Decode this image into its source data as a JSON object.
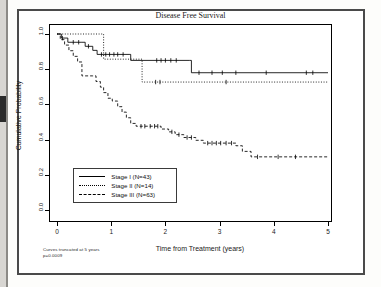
{
  "figure": {
    "title": "Disease Free Survival",
    "xlabel": "Time from Treatment (years)",
    "ylabel": "Cumulative Probability",
    "footnote_line1": "Curves truncated at 5 years",
    "footnote_line2": "p=0.0009"
  },
  "legend": {
    "items": [
      {
        "label": "Stage I (N=43)",
        "style": "solid"
      },
      {
        "label": "Stage II (N=14)",
        "style": "dotted"
      },
      {
        "label": "Stage III (N=63)",
        "style": "dashed"
      }
    ]
  },
  "axis": {
    "x_ticks": [
      "0",
      "1",
      "2",
      "3",
      "4",
      "5"
    ],
    "y_ticks": [
      "0.0",
      "0.2",
      "0.4",
      "0.6",
      "0.8",
      "1.0"
    ]
  },
  "chart_data": {
    "type": "line",
    "title": "Disease Free Survival",
    "xlabel": "Time from Treatment (years)",
    "ylabel": "Cumulative Probability",
    "xlim": [
      0,
      5
    ],
    "ylim": [
      0.0,
      1.0
    ],
    "grid": false,
    "legend_position": "lower-left",
    "annotations": [
      "Curves truncated at 5 years",
      "p=0.0009"
    ],
    "series": [
      {
        "name": "Stage I (N=43)",
        "n": 43,
        "style": "solid",
        "color": "#000000",
        "steps": [
          [
            0.0,
            1.0
          ],
          [
            0.08,
            0.977
          ],
          [
            0.2,
            0.953
          ],
          [
            0.46,
            0.953
          ],
          [
            0.52,
            0.93
          ],
          [
            0.66,
            0.907
          ],
          [
            0.74,
            0.884
          ],
          [
            1.33,
            0.884
          ],
          [
            1.36,
            0.85
          ],
          [
            2.45,
            0.85
          ],
          [
            2.48,
            0.78
          ],
          [
            5.0,
            0.78
          ]
        ],
        "censor_times": [
          0.1,
          0.3,
          0.4,
          0.58,
          0.82,
          0.9,
          0.97,
          1.05,
          1.12,
          1.22,
          1.84,
          1.92,
          2.0,
          2.1,
          2.2,
          2.62,
          2.86,
          3.05,
          3.3,
          3.86,
          4.6,
          4.72
        ]
      },
      {
        "name": "Stage II (N=14)",
        "n": 14,
        "style": "dotted",
        "color": "#000000",
        "steps": [
          [
            0.0,
            1.0
          ],
          [
            0.84,
            1.0
          ],
          [
            0.86,
            0.857
          ],
          [
            1.55,
            0.857
          ],
          [
            1.57,
            0.727
          ],
          [
            5.0,
            0.727
          ]
        ],
        "censor_times": [
          1.82,
          1.9,
          3.12
        ]
      },
      {
        "name": "Stage III (N=63)",
        "n": 63,
        "style": "dashed",
        "color": "#000000",
        "steps": [
          [
            0.0,
            1.0
          ],
          [
            0.06,
            0.968
          ],
          [
            0.14,
            0.937
          ],
          [
            0.22,
            0.905
          ],
          [
            0.3,
            0.873
          ],
          [
            0.38,
            0.841
          ],
          [
            0.46,
            0.762
          ],
          [
            0.66,
            0.762
          ],
          [
            0.72,
            0.73
          ],
          [
            0.8,
            0.698
          ],
          [
            0.86,
            0.667
          ],
          [
            0.94,
            0.635
          ],
          [
            1.02,
            0.619
          ],
          [
            1.12,
            0.587
          ],
          [
            1.2,
            0.556
          ],
          [
            1.28,
            0.524
          ],
          [
            1.36,
            0.492
          ],
          [
            1.46,
            0.476
          ],
          [
            1.92,
            0.46
          ],
          [
            2.06,
            0.444
          ],
          [
            2.18,
            0.428
          ],
          [
            2.34,
            0.412
          ],
          [
            2.56,
            0.396
          ],
          [
            2.7,
            0.38
          ],
          [
            3.3,
            0.365
          ],
          [
            3.42,
            0.333
          ],
          [
            3.58,
            0.302
          ],
          [
            5.0,
            0.302
          ]
        ],
        "censor_times": [
          1.55,
          1.62,
          1.72,
          1.8,
          1.86,
          2.12,
          2.25,
          2.4,
          2.48,
          2.78,
          2.86,
          2.94,
          3.02,
          3.12,
          3.22,
          3.7,
          4.08,
          4.4
        ]
      }
    ]
  }
}
